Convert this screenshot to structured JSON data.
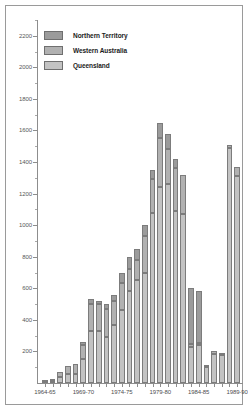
{
  "chart_data": {
    "type": "bar",
    "subtype": "stacked-bar",
    "title": "",
    "xlabel": "",
    "ylabel": "",
    "ylim": [
      0,
      2300
    ],
    "ytick_step": 200,
    "yminor_step": 100,
    "grid": false,
    "legend_position": "top-left",
    "ytick_labels": [
      "200",
      "400",
      "600",
      "800",
      "1000",
      "1200",
      "1400",
      "1600",
      "1800",
      "2000",
      "2200"
    ],
    "ytick_values": [
      200,
      400,
      600,
      800,
      1000,
      1200,
      1400,
      1600,
      1800,
      2000,
      2200
    ],
    "xtick_labels": [
      "1964-65",
      "1969-70",
      "1974-75",
      "1979-80",
      "1984-85",
      "1989-90"
    ],
    "xtick_categories": [
      "1964-65",
      "1969-70",
      "1974-75",
      "1979-80",
      "1984-85",
      "1989-90"
    ],
    "categories": [
      "1964-65",
      "1965-66",
      "1966-67",
      "1967-68",
      "1968-69",
      "1969-70",
      "1970-71",
      "1971-72",
      "1972-73",
      "1973-74",
      "1974-75",
      "1975-76",
      "1976-77",
      "1977-78",
      "1978-79",
      "1979-80",
      "1980-81",
      "1981-82",
      "1982-83",
      "1983-84",
      "1984-85",
      "1985-86",
      "1986-87",
      "1987-88",
      "1988-89",
      "1989-90"
    ],
    "series": [
      {
        "name": "Queensland",
        "color": "#c3c3c3",
        "values": [
          5,
          10,
          40,
          60,
          60,
          150,
          330,
          330,
          290,
          370,
          460,
          580,
          650,
          700,
          1080,
          1240,
          1260,
          1090,
          1070,
          230,
          240,
          100,
          185,
          175,
          1490,
          1310
        ]
      },
      {
        "name": "Western Australia",
        "color": "#b1b1b1",
        "values": [
          5,
          10,
          30,
          50,
          60,
          90,
          170,
          170,
          180,
          150,
          175,
          145,
          130,
          230,
          210,
          310,
          220,
          270,
          250,
          20,
          15,
          10,
          20,
          15,
          20,
          60
        ]
      },
      {
        "name": "Northern Territory",
        "color": "#9b9b9b",
        "values": [
          0,
          0,
          0,
          0,
          0,
          20,
          30,
          20,
          30,
          40,
          60,
          75,
          70,
          70,
          60,
          100,
          100,
          60,
          0,
          350,
          330,
          0,
          0,
          0,
          0,
          0
        ]
      }
    ],
    "totals": [
      10,
      20,
      70,
      110,
      120,
      260,
      530,
      520,
      500,
      560,
      695,
      800,
      850,
      1000,
      1350,
      1650,
      1580,
      1420,
      1320,
      600,
      585,
      110,
      205,
      190,
      1510,
      1370
    ]
  },
  "legend": {
    "items": [
      {
        "label": "Northern Territory",
        "color": "#9b9b9b"
      },
      {
        "label": "Western Australia",
        "color": "#b1b1b1"
      },
      {
        "label": "Queensland",
        "color": "#c3c3c3"
      }
    ]
  }
}
